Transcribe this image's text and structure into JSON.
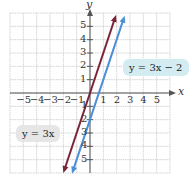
{
  "chart_data": {
    "type": "line",
    "title": "",
    "xlabel": "x",
    "ylabel": "y",
    "xlim": [
      -6,
      6
    ],
    "ylim": [
      -6,
      6
    ],
    "grid": true,
    "x_ticks": [
      "-5",
      "-4",
      "-3",
      "-2",
      "-1",
      "1",
      "2",
      "3",
      "4",
      "5"
    ],
    "y_ticks": [
      "5",
      "4",
      "3",
      "2",
      "1",
      "1",
      "2",
      "3",
      "4",
      "5"
    ],
    "series": [
      {
        "name": "y = 3x",
        "slope": 3,
        "intercept": 0,
        "color": "#7a2236",
        "x": [
          -2,
          1.95
        ],
        "y": [
          -6,
          5.85
        ]
      },
      {
        "name": "y = 3x - 2",
        "slope": 3,
        "intercept": -2,
        "color": "#4a8fd8",
        "x": [
          -1.35,
          2.6
        ],
        "y": [
          -6.05,
          5.8
        ]
      }
    ],
    "annotations": [
      {
        "text_lhs": "y",
        "text_eq": "=",
        "text_rhs": "3x − 2",
        "series": "y = 3x - 2",
        "background": "#d3ecf1"
      },
      {
        "text_lhs": "y",
        "text_eq": "=",
        "text_rhs": "3x",
        "series": "y = 3x",
        "background": "#e6e6e6"
      }
    ]
  },
  "labels": {
    "x_axis": "x",
    "y_axis": "y",
    "eq_blue": "y = 3x − 2",
    "eq_red": "y = 3x"
  },
  "ticks": {
    "xneg": [
      "−5",
      "−4",
      "−3",
      "−2",
      "−1"
    ],
    "xpos": [
      "1",
      "2",
      "3",
      "4",
      "5"
    ],
    "ypos": [
      "5",
      "4",
      "3",
      "2",
      "1"
    ],
    "yneg": [
      "1",
      "2",
      "3",
      "4",
      "5"
    ]
  }
}
